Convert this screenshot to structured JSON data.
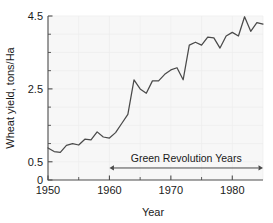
{
  "chart_data": {
    "type": "line",
    "title": "",
    "xlabel": "Year",
    "ylabel": "Wheat yield, tons/Ha",
    "xlim": [
      1950,
      1985
    ],
    "ylim": [
      0,
      4.5
    ],
    "grid": true,
    "legend": "none",
    "x_ticks": [
      1950,
      1960,
      1970,
      1980
    ],
    "x_tick_labels": [
      "1950",
      "1960",
      "1970",
      "1980"
    ],
    "x_minor_ticks": [
      1955,
      1965,
      1975,
      1985
    ],
    "y_ticks": [
      0,
      0.5,
      2.5,
      4.5
    ],
    "y_tick_labels": [
      "0",
      "0.5",
      "2.5",
      "4.5"
    ],
    "y_minor_ticks": [
      1.0,
      1.5,
      2.0,
      3.0,
      3.5,
      4.0
    ],
    "series": [
      {
        "name": "Wheat yield",
        "color": "#4a4a4a",
        "x": [
          1950,
          1951,
          1952,
          1953,
          1954,
          1955,
          1956,
          1957,
          1958,
          1959,
          1960,
          1961,
          1962,
          1963,
          1964,
          1965,
          1966,
          1967,
          1968,
          1969,
          1970,
          1971,
          1972,
          1973,
          1974,
          1975,
          1976,
          1977,
          1978,
          1979,
          1980,
          1981,
          1982,
          1983,
          1984,
          1985
        ],
        "values": [
          0.88,
          0.78,
          0.76,
          0.95,
          1.0,
          0.96,
          1.12,
          1.1,
          1.32,
          1.18,
          1.15,
          1.3,
          1.55,
          1.8,
          2.75,
          2.5,
          2.38,
          2.72,
          2.72,
          2.9,
          3.02,
          3.08,
          2.75,
          3.7,
          3.78,
          3.7,
          3.92,
          3.9,
          3.62,
          3.95,
          4.05,
          3.95,
          4.48,
          4.08,
          4.32,
          4.28
        ]
      }
    ],
    "annotations": [
      {
        "text": "Green Revolution Years",
        "type": "double-arrow",
        "x_start": 1960,
        "x_end": 1985,
        "y": 0.33
      }
    ]
  },
  "axes": {
    "x_axis_title": "Year",
    "y_axis_title": "Wheat yield, tons/Ha"
  },
  "colors": {
    "line": "#4a4a4a",
    "frame": "#4d4d4d",
    "grid": "#ededed",
    "plot_background": "#f7f7f7",
    "text": "#1a1a1a"
  }
}
